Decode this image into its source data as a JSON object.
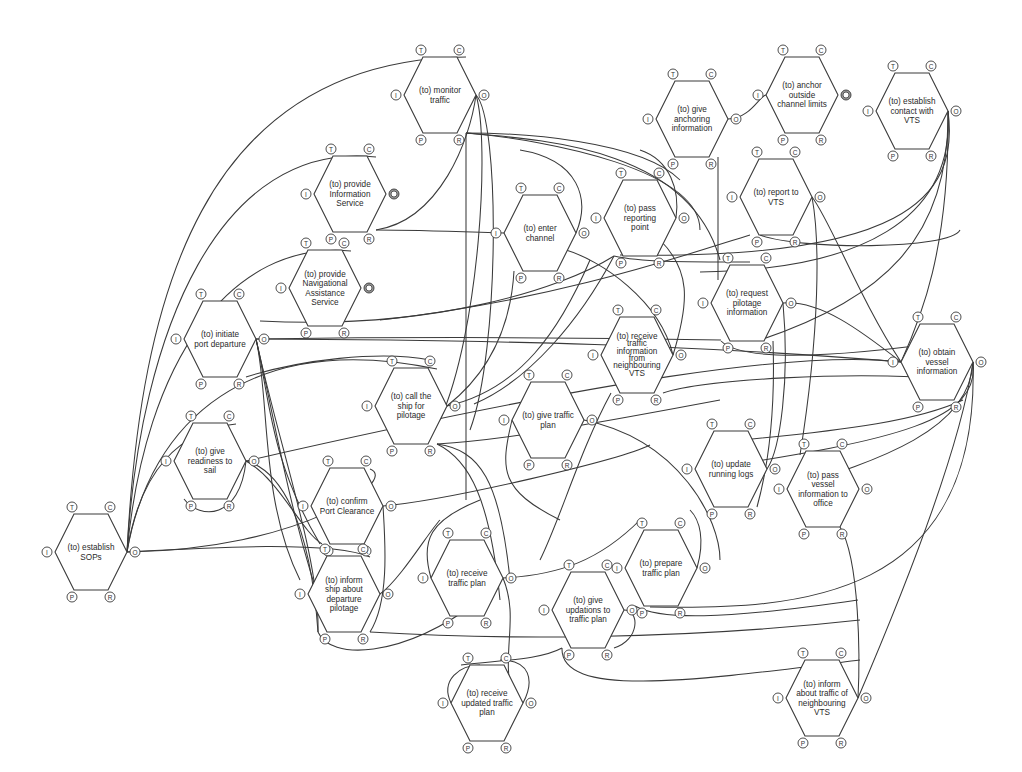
{
  "diagram": {
    "type": "FRAM functional resonance network",
    "aspect_labels": {
      "I": "I",
      "O": "O",
      "P": "P",
      "R": "R",
      "T": "T",
      "C": "C"
    },
    "functions": [
      {
        "id": "monitor-traffic",
        "label": [
          "(to) monitor",
          "traffic"
        ],
        "cx": 440,
        "cy": 95
      },
      {
        "id": "provide-info-service",
        "label": [
          "(to) provide",
          "Information",
          "Service"
        ],
        "cx": 350,
        "cy": 194,
        "double_o": true
      },
      {
        "id": "give-anchoring",
        "label": [
          "(to) give",
          "anchoring",
          "information"
        ],
        "cx": 692,
        "cy": 119
      },
      {
        "id": "anchor-outside",
        "label": [
          "(to) anchor",
          "outside",
          "channel limits"
        ],
        "cx": 802,
        "cy": 95,
        "double_o": true
      },
      {
        "id": "establish-contact-vts",
        "label": [
          "(to) establish",
          "contact with",
          "VTS"
        ],
        "cx": 912,
        "cy": 111
      },
      {
        "id": "enter-channel",
        "label": [
          "(to) enter",
          "channel"
        ],
        "cx": 540,
        "cy": 233
      },
      {
        "id": "pass-reporting-point",
        "label": [
          "(to) pass",
          "reporting",
          "point"
        ],
        "cx": 640,
        "cy": 218
      },
      {
        "id": "report-to-vts",
        "label": [
          "(to) report to",
          "VTS"
        ],
        "cx": 776,
        "cy": 197
      },
      {
        "id": "provide-nav-assist",
        "label": [
          "(to) provide",
          "Navigational",
          "Assistance",
          "Service"
        ],
        "cx": 325,
        "cy": 288,
        "double_o": true
      },
      {
        "id": "initiate-port-departure",
        "label": [
          "(to) initiate",
          "port departure"
        ],
        "cx": 220,
        "cy": 339
      },
      {
        "id": "request-pilotage-info",
        "label": [
          "(to) request",
          "pilotage",
          "information"
        ],
        "cx": 747,
        "cy": 303
      },
      {
        "id": "receive-traffic-info-vts",
        "label": [
          "(to) receive",
          "traffic",
          "information",
          "from",
          "neighbouring",
          "VTS"
        ],
        "cx": 637,
        "cy": 355,
        "small": true
      },
      {
        "id": "obtain-vessel-info",
        "label": [
          "(to) obtain",
          "vessel",
          "information"
        ],
        "cx": 937,
        "cy": 362
      },
      {
        "id": "call-ship-pilotage",
        "label": [
          "(to) call the",
          "ship for",
          "pilotage"
        ],
        "cx": 411,
        "cy": 406
      },
      {
        "id": "give-traffic-plan",
        "label": [
          "(to) give traffic",
          "plan"
        ],
        "cx": 548,
        "cy": 420
      },
      {
        "id": "give-readiness-sail",
        "label": [
          "(to) give",
          "readiness to",
          "sail"
        ],
        "cx": 210,
        "cy": 461
      },
      {
        "id": "update-running-logs",
        "label": [
          "(to) update",
          "running logs"
        ],
        "cx": 731,
        "cy": 469
      },
      {
        "id": "pass-vessel-info-office",
        "label": [
          "(to) pass",
          "vessel",
          "information to",
          "office"
        ],
        "cx": 823,
        "cy": 489
      },
      {
        "id": "confirm-port-clearance",
        "label": [
          "(to) confirm",
          "Port Clearance"
        ],
        "cx": 347,
        "cy": 506
      },
      {
        "id": "establish-sops",
        "label": [
          "(to) establish",
          "SOPs"
        ],
        "cx": 91,
        "cy": 552
      },
      {
        "id": "receive-traffic-plan",
        "label": [
          "(to) receive",
          "traffic plan"
        ],
        "cx": 467,
        "cy": 578
      },
      {
        "id": "prepare-traffic-plan",
        "label": [
          "(to) prepare",
          "traffic plan"
        ],
        "cx": 661,
        "cy": 568
      },
      {
        "id": "inform-ship-pilotage",
        "label": [
          "(to) inform",
          "ship about",
          "departure",
          "pilotage"
        ],
        "cx": 344,
        "cy": 594
      },
      {
        "id": "give-updations-plan",
        "label": [
          "(to) give",
          "updations to",
          "traffic plan"
        ],
        "cx": 588,
        "cy": 610
      },
      {
        "id": "receive-updated-plan",
        "label": [
          "(to) receive",
          "updated traffic",
          "plan"
        ],
        "cx": 487,
        "cy": 703
      },
      {
        "id": "inform-traffic-neighbour-vts",
        "label": [
          "(to) inform",
          "about traffic of",
          "neighbouring",
          "VTS"
        ],
        "cx": 822,
        "cy": 698
      }
    ]
  }
}
